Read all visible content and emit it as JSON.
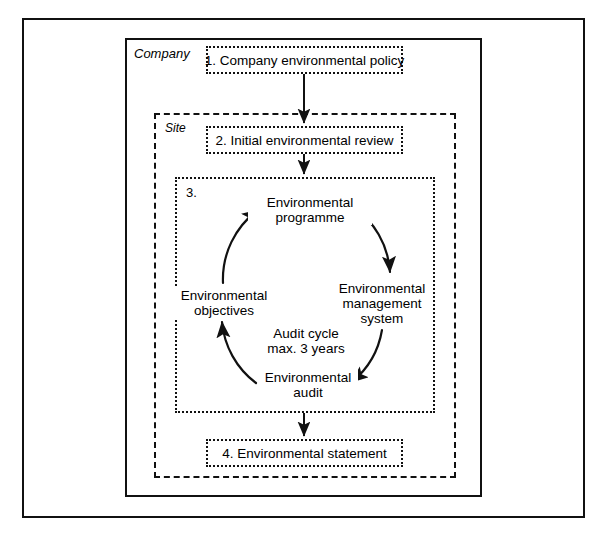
{
  "diagram": {
    "frames": {
      "outer": {
        "label": ""
      },
      "company": {
        "label": "Company"
      },
      "site": {
        "label": "Site"
      },
      "cycle": {
        "label": "3."
      }
    },
    "steps": [
      {
        "id": "step-1",
        "label": "1. Company environmental policy"
      },
      {
        "id": "step-2",
        "label": "2. Initial environmental review"
      },
      {
        "id": "step-4",
        "label": "4. Environmental statement"
      }
    ],
    "cycle": {
      "center_note_line1": "Audit cycle",
      "center_note_line2": "max. 3 years",
      "nodes": [
        {
          "id": "node-programme",
          "line1": "Environmental",
          "line2": "programme",
          "line3": ""
        },
        {
          "id": "node-management",
          "line1": "Environmental",
          "line2": "management",
          "line3": "system"
        },
        {
          "id": "node-audit",
          "line1": "Environmental",
          "line2": "audit",
          "line3": ""
        },
        {
          "id": "node-objectives",
          "line1": "Environmental",
          "line2": "objectives",
          "line3": ""
        }
      ],
      "direction": "clockwise"
    },
    "colors": {
      "line": "#111111",
      "background": "#ffffff",
      "text": "#000000"
    }
  }
}
